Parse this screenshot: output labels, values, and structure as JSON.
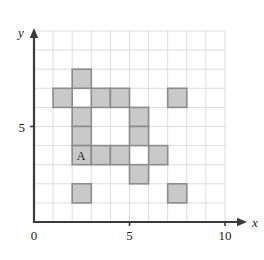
{
  "chart_data": {
    "type": "scatter",
    "title": "",
    "xlabel": "x",
    "ylabel": "y",
    "xlim": [
      0,
      10
    ],
    "ylim": [
      0,
      10
    ],
    "grid": true,
    "legend": false,
    "x_ticks": [
      {
        "value": 0,
        "label": "0"
      },
      {
        "value": 5,
        "label": "5"
      },
      {
        "value": 10,
        "label": "10"
      }
    ],
    "y_ticks": [
      {
        "value": 5,
        "label": "5"
      }
    ],
    "cell_size": 1,
    "shaded_cells": [
      {
        "x": 2,
        "y": 7,
        "label": ""
      },
      {
        "x": 1,
        "y": 6,
        "label": ""
      },
      {
        "x": 3,
        "y": 6,
        "label": ""
      },
      {
        "x": 4,
        "y": 6,
        "label": ""
      },
      {
        "x": 7,
        "y": 6,
        "label": ""
      },
      {
        "x": 2,
        "y": 5,
        "label": ""
      },
      {
        "x": 5,
        "y": 5,
        "label": ""
      },
      {
        "x": 2,
        "y": 4,
        "label": ""
      },
      {
        "x": 5,
        "y": 4,
        "label": ""
      },
      {
        "x": 2,
        "y": 3,
        "label": "A"
      },
      {
        "x": 3,
        "y": 3,
        "label": ""
      },
      {
        "x": 4,
        "y": 3,
        "label": ""
      },
      {
        "x": 6,
        "y": 3,
        "label": ""
      },
      {
        "x": 5,
        "y": 2,
        "label": ""
      },
      {
        "x": 2,
        "y": 1,
        "label": ""
      },
      {
        "x": 7,
        "y": 1,
        "label": ""
      }
    ],
    "annotations": [
      {
        "text": "A",
        "x": 2,
        "y": 3
      }
    ],
    "colors": {
      "cell_fill": "#c9c9c9",
      "cell_stroke": "#8c8c8c",
      "gridline": "#d9dde2",
      "axis": "#3a3a3a",
      "background": "#ffffff"
    }
  },
  "axis_labels": {
    "x": "x",
    "y": "y"
  }
}
